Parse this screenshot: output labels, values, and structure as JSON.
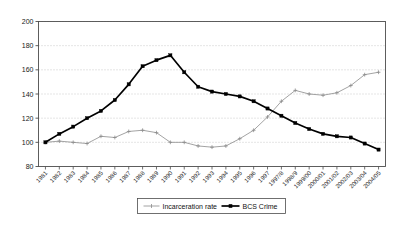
{
  "chart_data": {
    "type": "line",
    "title": "",
    "xlabel": "",
    "ylabel": "",
    "ylim": [
      80,
      200
    ],
    "yticks": [
      80,
      100,
      120,
      140,
      160,
      180,
      200
    ],
    "grid": true,
    "legend_position": "bottom-center",
    "categories": [
      "1981",
      "1982",
      "1983",
      "1984",
      "1985",
      "1986",
      "1987",
      "1988",
      "1989",
      "1990",
      "1991",
      "1992",
      "1993",
      "1994",
      "1995",
      "1996",
      "1997",
      "1997/8",
      "1998/9",
      "1999/00",
      "2000/01",
      "2001/02",
      "2002/03",
      "2003/04",
      "2004/05"
    ],
    "series": [
      {
        "name": "Incarceration rate",
        "color": "#8c8c8c",
        "marker": "plus",
        "values": [
          100,
          101,
          100,
          99,
          105,
          104,
          109,
          110,
          108,
          100,
          100,
          97,
          96,
          97,
          103,
          110,
          121,
          134,
          143,
          140,
          139,
          141,
          147,
          156,
          158
        ]
      },
      {
        "name": "BCS Crime",
        "color": "#000000",
        "marker": "square",
        "values": [
          100,
          107,
          113,
          120,
          126,
          135,
          148,
          163,
          168,
          172,
          158,
          146,
          142,
          140,
          138,
          134,
          128,
          122,
          116,
          111,
          107,
          105,
          104,
          99,
          94
        ]
      }
    ]
  },
  "legend": {
    "items": [
      {
        "label": "Incarceration rate"
      },
      {
        "label": "BCS Crime"
      }
    ]
  },
  "axes": {
    "y_tick_labels": [
      "200",
      "180",
      "160",
      "140",
      "120",
      "100",
      "80"
    ]
  }
}
